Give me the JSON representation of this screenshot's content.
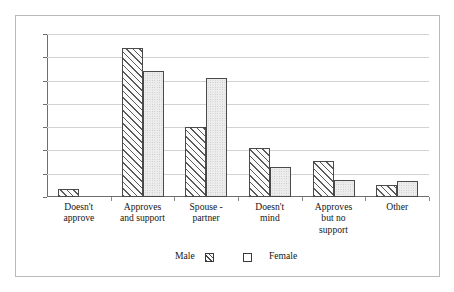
{
  "figure": {
    "border_color": "#b9b9b9",
    "background": "#ffffff"
  },
  "legend": {
    "position": "bottom-center",
    "entries": [
      {
        "label": "Male",
        "swatch": "male-hatched-swatch"
      },
      {
        "label": "Female",
        "swatch": "female-plain-swatch"
      }
    ]
  },
  "chart_data": {
    "type": "bar",
    "title": "",
    "subtitle": "",
    "xlabel": "",
    "ylabel": "",
    "grid": true,
    "legend_position": "bottom-center",
    "ylim": [
      0,
      7
    ],
    "yticks": [
      0,
      1,
      2,
      3,
      4,
      5,
      6,
      7
    ],
    "ytick_labels": [
      "",
      "",
      "",
      "",
      "",
      "",
      "",
      ""
    ],
    "categories": [
      "Doesn't\napprove",
      "Approves\nand support",
      "Spouse -\npartner",
      "Doesn't\nmind",
      "Approves\nbut no\nsupport",
      "Other"
    ],
    "series": [
      {
        "name": "Male",
        "values": [
          0.35,
          6.4,
          3.0,
          2.1,
          1.55,
          0.5
        ]
      },
      {
        "name": "Female",
        "values": [
          0.0,
          5.4,
          5.1,
          1.3,
          0.75,
          0.7
        ]
      }
    ]
  }
}
